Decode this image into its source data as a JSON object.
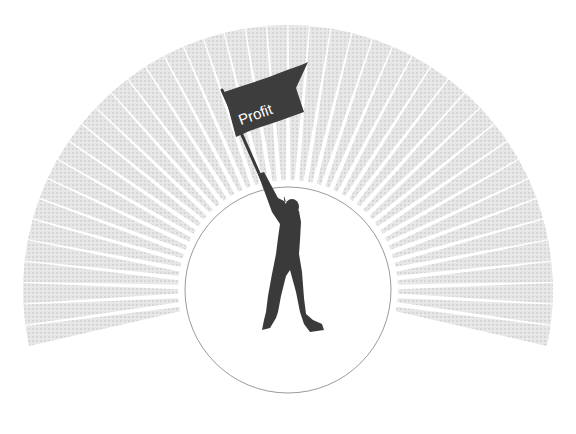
{
  "illustration": {
    "flag": {
      "label": "Profit",
      "color": "#3d3d3d",
      "text_color": "#ffffff"
    },
    "figure": {
      "color": "#3a3a3a"
    },
    "circle": {
      "stroke": "#9a9a9a",
      "fill": "#ffffff"
    },
    "rays": {
      "color": "#d8d8d8",
      "count": 44
    }
  }
}
